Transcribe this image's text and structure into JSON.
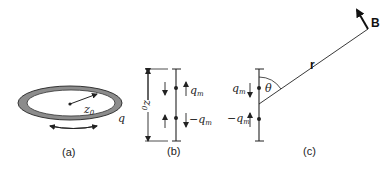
{
  "figure": {
    "panels": [
      {
        "id": "a",
        "caption": "(a)",
        "description": "Current loop (ring) of radius z0 with circulating charge q",
        "labels": {
          "radius": "z",
          "radius_sub": "0",
          "charge": "q"
        }
      },
      {
        "id": "b",
        "caption": "(b)",
        "description": "Equivalent magnetic dipole: separated magnetic charges",
        "labels": {
          "separation": "z",
          "separation_sub": "0",
          "top_charge": "q",
          "top_charge_sub": "m",
          "bottom_charge": "−q",
          "bottom_charge_sub": "m"
        }
      },
      {
        "id": "c",
        "caption": "(c)",
        "description": "Field B at position r, angle θ from dipole axis",
        "labels": {
          "top_charge": "q",
          "top_charge_sub": "m",
          "bottom_charge": "−q",
          "bottom_charge_sub": "m",
          "angle": "θ",
          "position_vector": "r",
          "field": "B"
        }
      }
    ],
    "colors": {
      "ink": "#222222",
      "ring_fill": "#8c8c8c",
      "background": "#ffffff"
    }
  }
}
